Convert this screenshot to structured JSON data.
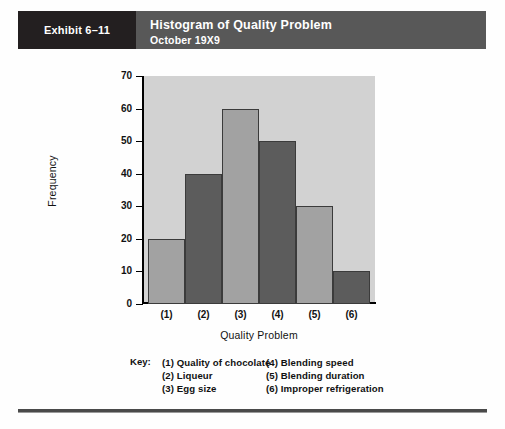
{
  "header": {
    "exhibit_tag": "Exhibit 6–11",
    "title": "Histogram of Quality Problem",
    "subtitle": "October 19X9",
    "tag_bg": "#231f20",
    "bar_bg": "#585858",
    "text_color": "#ffffff"
  },
  "chart_data": {
    "type": "bar",
    "title": "Histogram of Quality Problem",
    "subtitle": "October 19X9",
    "xlabel": "Quality Problem",
    "ylabel": "Frequency",
    "categories": [
      "(1)",
      "(2)",
      "(3)",
      "(4)",
      "(5)",
      "(6)"
    ],
    "values": [
      20,
      40,
      60,
      50,
      30,
      10
    ],
    "ylim": [
      0,
      70
    ],
    "ytick_labels": [
      "70",
      "60",
      "50",
      "40",
      "30",
      "20",
      "10",
      "0"
    ],
    "yticks": [
      70,
      60,
      50,
      40,
      30,
      20,
      10,
      0
    ],
    "grid": false,
    "legend_position": "below-plot",
    "bar_colors": [
      "#a2a2a2",
      "#5c5c5c",
      "#a2a2a2",
      "#5c5c5c",
      "#a2a2a2",
      "#5c5c5c"
    ],
    "plot_background": "#d2d2d2",
    "bar_edge_color": "#3b3b3b"
  },
  "key": {
    "label": "Key:",
    "left_column": [
      "(1) Quality of chocolate",
      "(2) Liqueur",
      "(3) Egg size"
    ],
    "right_column": [
      "(4) Blending speed",
      "(5) Blending duration",
      "(6) Improper refrigeration"
    ]
  }
}
